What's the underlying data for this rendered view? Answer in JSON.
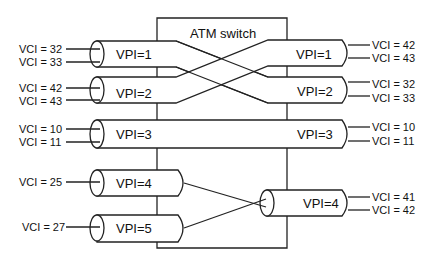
{
  "diagram": {
    "title": "ATM switch",
    "colors": {
      "stroke": "#222222",
      "background": "#ffffff",
      "text": "#111111"
    },
    "inputs": [
      {
        "vpi": "VPI=1",
        "vci": [
          "VCI = 32",
          "VCI = 33"
        ]
      },
      {
        "vpi": "VPI=2",
        "vci": [
          "VCI = 42",
          "VCI = 43"
        ]
      },
      {
        "vpi": "VPI=3",
        "vci": [
          "VCI = 10",
          "VCI = 11"
        ]
      },
      {
        "vpi": "VPI=4",
        "vci": [
          "VCI = 25"
        ]
      },
      {
        "vpi": "VPI=5",
        "vci": [
          "VCI = 27"
        ]
      }
    ],
    "outputs": [
      {
        "vpi": "VPI=1",
        "vci": [
          "VCI = 42",
          "VCI = 43"
        ]
      },
      {
        "vpi": "VPI=2",
        "vci": [
          "VCI = 32",
          "VCI = 33"
        ]
      },
      {
        "vpi": "VPI=3",
        "vci": [
          "VCI = 10",
          "VCI = 11"
        ]
      },
      {
        "vpi": "VPI=4",
        "vci": [
          "VCI = 41",
          "VCI = 42"
        ]
      }
    ],
    "connections": [
      {
        "from": "VPI=1 (in)",
        "to": "VPI=2 (out)"
      },
      {
        "from": "VPI=2 (in)",
        "to": "VPI=1 (out)"
      },
      {
        "from": "VPI=3 (in)",
        "to": "VPI=3 (out)"
      },
      {
        "from": "VPI=4 (in)",
        "to": "VPI=4 (out)"
      },
      {
        "from": "VPI=5 (in)",
        "to": "VPI=4 (out)"
      }
    ]
  }
}
